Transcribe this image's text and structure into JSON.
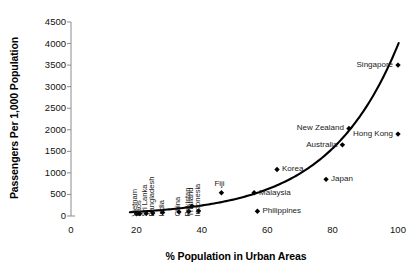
{
  "chart_data": {
    "type": "scatter",
    "title": "",
    "xlabel": "% Population in Urban Areas",
    "ylabel": "Passengers Per 1,000 Population",
    "xlim": [
      0,
      100
    ],
    "ylim": [
      0,
      4500
    ],
    "xticks": [
      "0",
      "20",
      "40",
      "60",
      "80",
      "100"
    ],
    "yticks": [
      "0",
      "500",
      "1000",
      "1500",
      "2000",
      "2500",
      "3000",
      "3500",
      "4000",
      "4500"
    ],
    "grid": false,
    "legend": "none",
    "marker": "diamond",
    "marker_color": "#000000",
    "trend_line": {
      "present": true,
      "style": "solid",
      "color": "#000000",
      "description": "exponential trend curve rising steeply above 80% urban"
    },
    "points": [
      {
        "name": "Vietnam",
        "x": 20,
        "y": 50,
        "label_pos": "rot"
      },
      {
        "name": "Laos",
        "x": 21,
        "y": 55,
        "label_pos": "rot"
      },
      {
        "name": "Sri Lanka",
        "x": 23,
        "y": 60,
        "label_pos": "rot"
      },
      {
        "name": "Bangladesh",
        "x": 25,
        "y": 70,
        "label_pos": "rot"
      },
      {
        "name": "India",
        "x": 28,
        "y": 80,
        "label_pos": "rot"
      },
      {
        "name": "China",
        "x": 33,
        "y": 95,
        "label_pos": "rot"
      },
      {
        "name": "Pakistan",
        "x": 36,
        "y": 105,
        "label_pos": "rot"
      },
      {
        "name": "Thailand",
        "x": 37,
        "y": 230,
        "label_pos": "rot"
      },
      {
        "name": "Indonesia",
        "x": 39,
        "y": 115,
        "label_pos": "rot"
      },
      {
        "name": "Fiji",
        "x": 46,
        "y": 540,
        "label_pos": "above"
      },
      {
        "name": "Malaysia",
        "x": 56,
        "y": 540,
        "label_pos": "right"
      },
      {
        "name": "Philippines",
        "x": 57,
        "y": 110,
        "label_pos": "right"
      },
      {
        "name": "Korea",
        "x": 63,
        "y": 1080,
        "label_pos": "right"
      },
      {
        "name": "Japan",
        "x": 78,
        "y": 850,
        "label_pos": "right"
      },
      {
        "name": "Australia",
        "x": 83,
        "y": 1650,
        "label_pos": "left"
      },
      {
        "name": "New Zealand",
        "x": 85,
        "y": 2030,
        "label_pos": "left"
      },
      {
        "name": "Hong Kong",
        "x": 100,
        "y": 1900,
        "label_pos": "left"
      },
      {
        "name": "Singapore",
        "x": 100,
        "y": 3500,
        "label_pos": "left"
      }
    ]
  }
}
